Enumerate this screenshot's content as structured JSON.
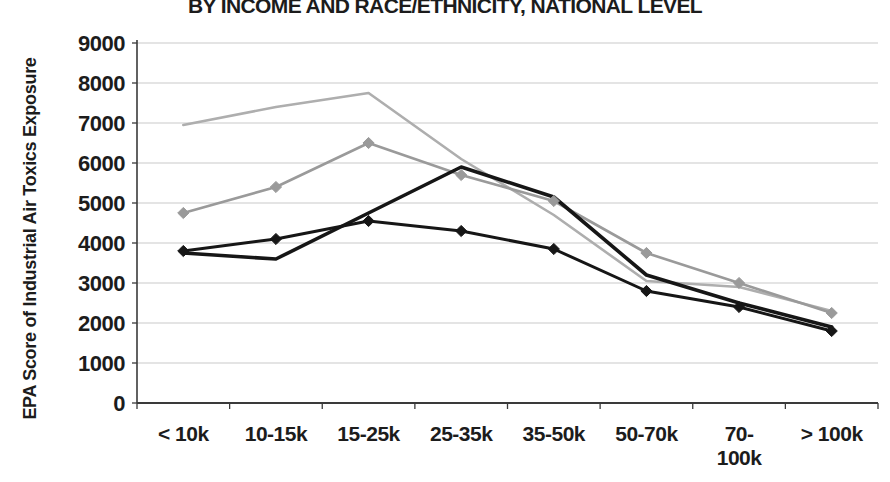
{
  "title": "BY INCOME AND RACE/ETHNICITY, NATIONAL LEVEL",
  "y_axis_title": "EPA Score of Industrial Air Toxics Exposure",
  "chart_data": {
    "type": "line",
    "title": "BY INCOME AND RACE/ETHNICITY, NATIONAL LEVEL",
    "xlabel": "",
    "ylabel": "EPA Score of Industrial Air Toxics Exposure",
    "categories": [
      "< 10k",
      "10-15k",
      "15-25k",
      "25-35k",
      "35-50k",
      "50-70k",
      "70-100k",
      "> 100k"
    ],
    "category_display": [
      [
        "< 10k"
      ],
      [
        "10-15k"
      ],
      [
        "15-25k"
      ],
      [
        "25-35k"
      ],
      [
        "35-50k"
      ],
      [
        "50-70k"
      ],
      [
        "70-",
        "100k"
      ],
      [
        "> 100k"
      ]
    ],
    "ylim": [
      0,
      9000
    ],
    "y_tick_step": 1000,
    "y_ticks": [
      0,
      1000,
      2000,
      3000,
      4000,
      5000,
      6000,
      7000,
      8000,
      9000
    ],
    "grid": true,
    "legend_position": "none",
    "colors": {
      "light_gray_series": "#a9a9a9",
      "gray_series": "#9a9a9a",
      "black_series": "#161616",
      "gridline": "#c9c9c9",
      "axis": "#3a3a3a"
    },
    "series": [
      {
        "name": "gray-line-no-markers",
        "color": "#aeaeae",
        "marker": false,
        "width": 2.6,
        "values": [
          6950,
          7400,
          7750,
          6100,
          4700,
          3050,
          2900,
          2300
        ]
      },
      {
        "name": "gray-line-diamonds",
        "color": "#9a9a9a",
        "marker": true,
        "width": 2.6,
        "values": [
          4750,
          5400,
          6500,
          5700,
          5050,
          3750,
          3000,
          2250
        ]
      },
      {
        "name": "black-line-no-markers",
        "color": "#161616",
        "marker": false,
        "width": 3.6,
        "values": [
          3750,
          3600,
          4750,
          5900,
          5150,
          3200,
          2500,
          1900
        ]
      },
      {
        "name": "black-line-diamonds",
        "color": "#161616",
        "marker": true,
        "width": 3.0,
        "values": [
          3800,
          4100,
          4550,
          4300,
          3850,
          2800,
          2400,
          1800
        ]
      }
    ]
  }
}
